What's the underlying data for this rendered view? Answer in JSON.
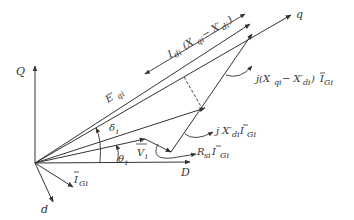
{
  "diagram": {
    "axes": {
      "Q": "Q",
      "D": "D",
      "q": "q",
      "d": "d"
    },
    "labels": {
      "E_qi": "E′",
      "E_qi_sub": "qi",
      "I_di_factor": "I",
      "I_di_sub": "di",
      "I_di_expr": "(X",
      "I_di_expr_qi": "qi",
      "I_di_expr_minus": " − X′",
      "I_di_expr_di": "di",
      "I_di_expr_close": ")",
      "jXqXd_I_prefix": "j(X",
      "jXqXd_I_qi": "qi",
      "jXqXd_I_minus": " − X′",
      "jXqXd_I_di": "di",
      "jXqXd_I_close": ") ",
      "jXqXd_I_I": "I",
      "jXqXd_I_Gi": "Gi",
      "jXd_I_prefix": "j X′",
      "jXd_I_di": "di",
      "jXd_I_I": " I",
      "jXd_I_Gi": "Gi",
      "R_I_prefix": "R",
      "R_I_si": "si",
      "R_I_I": " I",
      "R_I_Gi": "Gi",
      "delta": "δ",
      "delta_sub": "i",
      "theta": "θ",
      "theta_sub": "i",
      "V": "V",
      "V_sub": "i",
      "I_G": "I",
      "I_G_sub": "Gi"
    },
    "colors": {
      "stroke": "#333333",
      "text": "#333333"
    }
  }
}
